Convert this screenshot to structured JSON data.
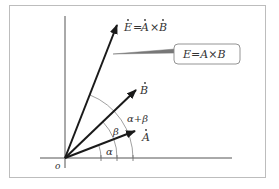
{
  "diagram": {
    "origin_label": "o",
    "vectors": [
      {
        "name": "A",
        "label": "A",
        "dotted": true
      },
      {
        "name": "B",
        "label": "B",
        "dotted": true
      },
      {
        "name": "E",
        "label_parts": [
          "E",
          "=",
          "A",
          "×",
          "B"
        ],
        "dotted": true
      }
    ],
    "angle_labels": {
      "alpha": "α",
      "beta": "β",
      "alpha_plus_beta": "α+β"
    },
    "callout": {
      "text": "E=A×B"
    }
  }
}
